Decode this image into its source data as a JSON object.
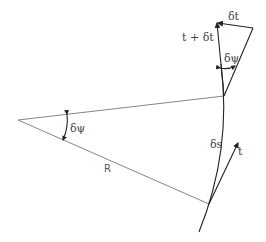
{
  "figure": {
    "type": "geometry-diagram",
    "labels": {
      "center_angle": "δψ",
      "radius": "R",
      "arc_length": "δs",
      "tangent": "t",
      "tangent_sum": "t + δt",
      "tangent_delta": "δt",
      "triangle_angle": "δψ"
    },
    "colors": {
      "line": "#777777",
      "arrow": "#222222",
      "text": "#444444",
      "background": "#ffffff"
    }
  }
}
